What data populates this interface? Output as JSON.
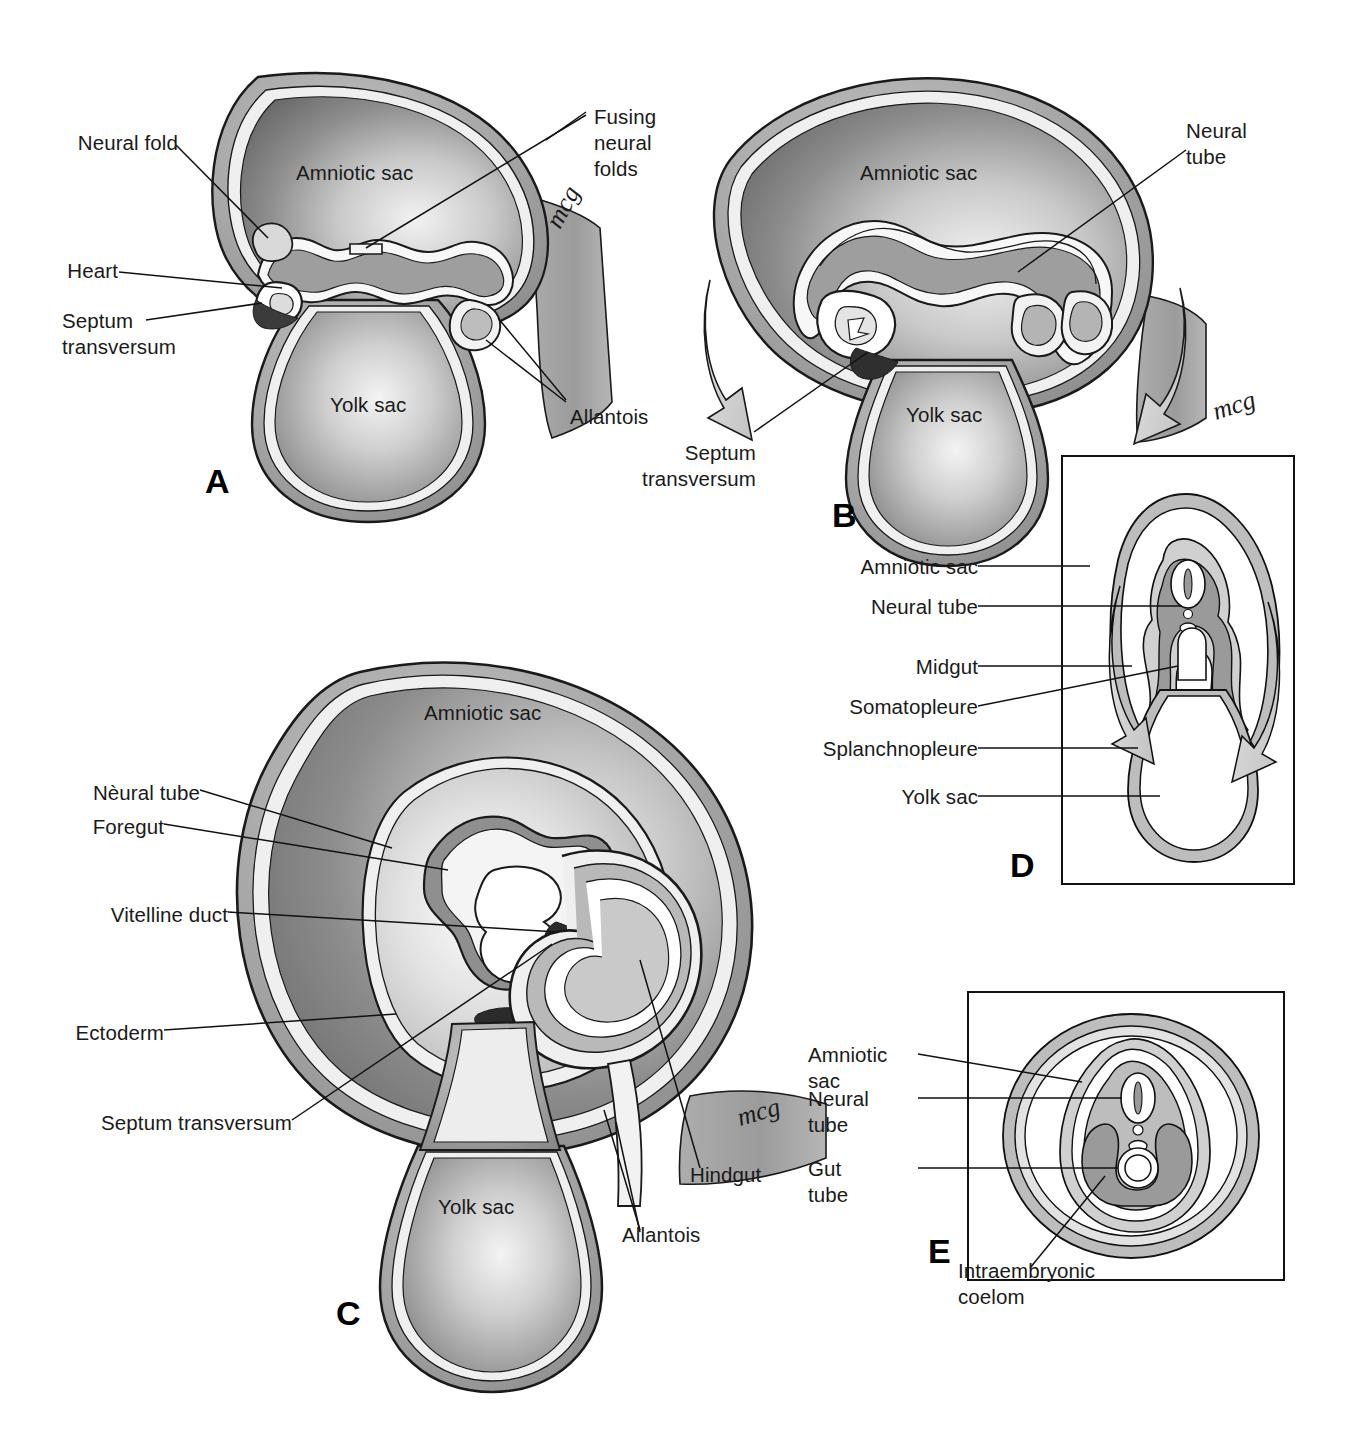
{
  "figure": {
    "type": "embryology-diagram",
    "artist_signature": "mcg",
    "panels": [
      {
        "id": "A",
        "letter": "A",
        "view": "sagittal",
        "labels": [
          {
            "text": "Neural fold"
          },
          {
            "text": "Fusing\nneural\nfolds"
          },
          {
            "text": "Amniotic sac"
          },
          {
            "text": "Heart"
          },
          {
            "text": "Septum\ntransversum"
          },
          {
            "text": "Yolk sac"
          },
          {
            "text": "Allantois"
          }
        ]
      },
      {
        "id": "B",
        "letter": "B",
        "view": "sagittal",
        "labels": [
          {
            "text": "Neural\ntube"
          },
          {
            "text": "Amniotic sac"
          },
          {
            "text": "Septum\ntransversum"
          },
          {
            "text": "Yolk sac"
          }
        ]
      },
      {
        "id": "C",
        "letter": "C",
        "view": "sagittal",
        "labels": [
          {
            "text": "Amniotic sac"
          },
          {
            "text": "Nèural tube"
          },
          {
            "text": "Foregut"
          },
          {
            "text": "Vitelline duct"
          },
          {
            "text": "Ectoderm"
          },
          {
            "text": "Septum transversum"
          },
          {
            "text": "Yolk sac"
          },
          {
            "text": "Hindgut"
          },
          {
            "text": "Allantois"
          }
        ]
      },
      {
        "id": "D",
        "letter": "D",
        "view": "transverse",
        "boxed": true,
        "labels": [
          {
            "text": "Amniotic sac"
          },
          {
            "text": "Neural tube"
          },
          {
            "text": "Midgut"
          },
          {
            "text": "Somatopleure"
          },
          {
            "text": "Splanchnopleure"
          },
          {
            "text": "Yolk sac"
          }
        ]
      },
      {
        "id": "E",
        "letter": "E",
        "view": "transverse",
        "boxed": true,
        "labels": [
          {
            "text": "Amniotic\nsac"
          },
          {
            "text": "Neural\ntube"
          },
          {
            "text": "Gut\ntube"
          },
          {
            "text": "Intraembryonic\ncoelom"
          }
        ]
      }
    ],
    "label_text": {
      "neural_fold": "Neural fold",
      "fusing_neural_folds_l1": "Fusing",
      "fusing_neural_folds_l2": "neural",
      "fusing_neural_folds_l3": "folds",
      "amniotic_sac": "Amniotic sac",
      "amniotic_l1": "Amniotic",
      "amniotic_l2": "sac",
      "heart": "Heart",
      "septum_l1": "Septum",
      "septum_l2": "transversum",
      "septum_transversum_inline": "Septum transversum",
      "yolk_sac": "Yolk sac",
      "allantois": "Allantois",
      "neural_tube": "Neural tube",
      "neural_l1": "Neural",
      "neural_l2": "tube",
      "neural_tube_accented": "Nèural tube",
      "foregut": "Foregut",
      "vitelline_duct": "Vitelline duct",
      "ectoderm": "Ectoderm",
      "hindgut": "Hindgut",
      "midgut": "Midgut",
      "somatopleure": "Somatopleure",
      "splanchnopleure": "Splanchnopleure",
      "gut_l1": "Gut",
      "gut_l2": "tube",
      "intraembryonic_l1": "Intraembryonic",
      "intraembryonic_l2": "coelom",
      "letter_a": "A",
      "letter_b": "B",
      "letter_c": "C",
      "letter_d": "D",
      "letter_e": "E",
      "signature": "mcg"
    },
    "colors": {
      "ink": "#111111",
      "outline": "#1a1a1a",
      "sac_mid": "#9a9a9a",
      "sac_dark": "#6f6f6f",
      "sac_light": "#e8e8e8",
      "membrane_light": "#d4d4d4",
      "membrane_dark": "#a6a6a6",
      "white": "#ffffff",
      "box_border": "#111111",
      "arrow_fill": "#d8d8d8"
    }
  }
}
